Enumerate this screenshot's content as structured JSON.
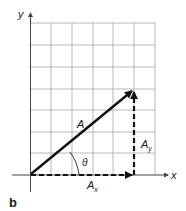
{
  "figure": {
    "panel_label": "b",
    "axes": {
      "x_label": "x",
      "y_label": "y"
    },
    "vector": {
      "label": "A",
      "angle_label": "θ"
    },
    "components": {
      "x": {
        "label": "A",
        "subscript": "x"
      },
      "y": {
        "label": "A",
        "subscript": "y"
      }
    },
    "grid": {
      "columns": 6,
      "rows": 7
    },
    "colors": {
      "grid": "#b0b0b0",
      "vector": "#111111",
      "axis": "#555555"
    }
  }
}
